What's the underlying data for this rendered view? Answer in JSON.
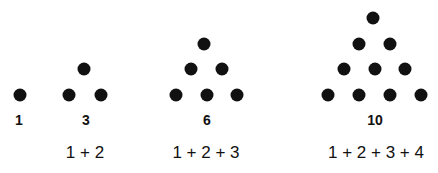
{
  "dot_color": "#111111",
  "figures": [
    {
      "count": "1",
      "sum": "",
      "dots": [
        [
          20,
          95
        ]
      ],
      "count_x": 19,
      "sum_x": 20
    },
    {
      "count": "3",
      "sum": "1 + 2",
      "dots": [
        [
          84,
          69
        ],
        [
          69,
          95
        ],
        [
          101,
          95
        ]
      ],
      "count_x": 86,
      "sum_x": 85
    },
    {
      "count": "6",
      "sum": "1 + 2 + 3",
      "dots": [
        [
          204,
          44
        ],
        [
          191,
          69
        ],
        [
          222,
          69
        ],
        [
          176,
          95
        ],
        [
          207,
          95
        ],
        [
          237,
          95
        ]
      ],
      "count_x": 207,
      "sum_x": 206
    },
    {
      "count": "10",
      "sum": "1 + 2 + 3 + 4",
      "dots": [
        [
          373,
          18
        ],
        [
          359,
          44
        ],
        [
          390,
          44
        ],
        [
          344,
          69
        ],
        [
          375,
          69
        ],
        [
          405,
          69
        ],
        [
          328,
          95
        ],
        [
          359,
          95
        ],
        [
          390,
          95
        ],
        [
          421,
          95
        ]
      ],
      "count_x": 375,
      "sum_x": 376
    }
  ]
}
